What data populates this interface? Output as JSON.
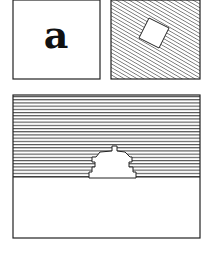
{
  "figure": {
    "panel_a": {
      "label": "a",
      "description": "plain square with letter"
    },
    "panel_b": {
      "description": "diagonally hatched square with a rotated white square"
    },
    "panel_c": {
      "description": "horizontally hatched upper region with stepped white mound over plain lower region"
    }
  },
  "colors": {
    "ink": "#1a1a1a",
    "paper": "#ffffff"
  }
}
